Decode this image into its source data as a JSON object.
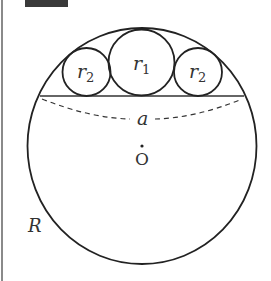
{
  "figure": {
    "type": "geometry-diagram",
    "labels": {
      "small_circle_left": "r",
      "small_circle_left_sub": "2",
      "middle_circle": "r",
      "middle_circle_sub": "1",
      "small_circle_right": "r",
      "small_circle_right_sub": "2",
      "chord": "a",
      "center": "O",
      "big_radius": "R"
    },
    "colors": {
      "stroke": "#222222",
      "text": "#333333",
      "header_block": "#3a3a3a",
      "border": "#8a8a8a"
    }
  }
}
